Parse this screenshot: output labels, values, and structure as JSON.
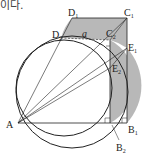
{
  "header": {
    "text": "이다."
  },
  "diagram": {
    "points": {
      "A": "A",
      "B1": "B",
      "B1_sub": "1",
      "B2": "B",
      "B2_sub": "2",
      "C1": "C",
      "C1_sub": "1",
      "C2": "C",
      "C2_sub": "2",
      "D1": "D",
      "D1_sub": "1",
      "D2": "D",
      "D2_sub": "2",
      "E1": "E",
      "E1_sub": "1",
      "E2": "E",
      "E2_sub": "2"
    },
    "length_label": "a",
    "colors": {
      "shade": "#b8b8b8",
      "line": "#222222"
    }
  }
}
